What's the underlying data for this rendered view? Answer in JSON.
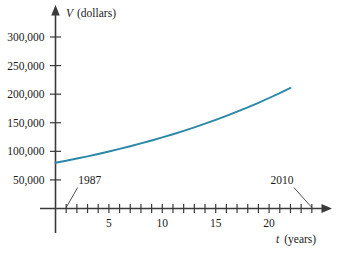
{
  "chart_data": {
    "type": "line",
    "title": "",
    "subtitle": "",
    "xlabel": "t (years)",
    "xlabel_variable": "t",
    "xlabel_unit": "(years)",
    "ylabel": "V (dollars)",
    "ylabel_variable": "V",
    "ylabel_unit": "(dollars)",
    "xlim": [
      0,
      25.5
    ],
    "ylim": [
      0,
      320000
    ],
    "grid": false,
    "legend": null,
    "curve_color": "#2b87a8",
    "axis_color": "#3a3a3a",
    "y_ticks": [
      {
        "value": 50000,
        "label": "50,000"
      },
      {
        "value": 100000,
        "label": "100,000"
      },
      {
        "value": 150000,
        "label": "150,000"
      },
      {
        "value": 200000,
        "label": "200,000"
      },
      {
        "value": 250000,
        "label": "250,000"
      },
      {
        "value": 300000,
        "label": "300,000"
      }
    ],
    "x_ticks": [
      1,
      2,
      3,
      4,
      5,
      6,
      7,
      8,
      9,
      10,
      11,
      12,
      13,
      14,
      15,
      16,
      17,
      18,
      19,
      20,
      21,
      22,
      23,
      24
    ],
    "x_tick_labels": [
      {
        "value": 5,
        "label": "5"
      },
      {
        "value": 10,
        "label": "10"
      },
      {
        "value": 15,
        "label": "15"
      },
      {
        "value": 20,
        "label": "20"
      }
    ],
    "series": [
      {
        "name": "V(t)",
        "x": [
          0,
          1,
          2,
          3,
          4,
          5,
          6,
          7,
          8,
          9,
          10,
          11,
          12,
          13,
          14,
          15,
          16,
          17,
          18,
          19,
          20,
          21,
          22
        ],
        "values": [
          80000,
          83600,
          87400,
          91300,
          95400,
          99700,
          104200,
          108900,
          113800,
          119000,
          124300,
          129900,
          135800,
          141900,
          148300,
          155000,
          162000,
          169300,
          176900,
          184900,
          193300,
          202000,
          211000
        ]
      }
    ],
    "annotations": [
      {
        "text": "1987",
        "points_to_x": 1,
        "points_to_y": 0,
        "text_x": 3.2,
        "text_y": 42000
      },
      {
        "text": "2010",
        "points_to_x": 24,
        "points_to_y": 0,
        "text_x": 21.2,
        "text_y": 42000
      }
    ]
  }
}
